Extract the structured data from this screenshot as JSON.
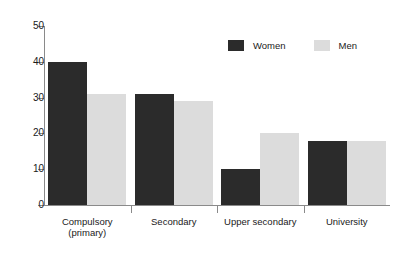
{
  "chart_data": {
    "type": "bar",
    "title": "",
    "subtitle": "",
    "xlabel": "",
    "ylabel": "",
    "ylim": [
      0,
      50
    ],
    "yticks": [
      0,
      10,
      20,
      30,
      40,
      50
    ],
    "grid": false,
    "legend_position": "top-right",
    "categories": [
      "Compulsory (primary)",
      "Secondary",
      "Upper secondary",
      "University"
    ],
    "category_lines": [
      [
        "Compulsory",
        "(primary)"
      ],
      [
        "Secondary"
      ],
      [
        "Upper secondary"
      ],
      [
        "University"
      ]
    ],
    "series": [
      {
        "name": "Women",
        "color": "#2b2b2b",
        "values": [
          40,
          31,
          10,
          18
        ]
      },
      {
        "name": "Men",
        "color": "#dcdcdc",
        "values": [
          31,
          29,
          20,
          18
        ]
      }
    ]
  },
  "axis": {
    "tick_labels": [
      "0",
      "10",
      "20",
      "30",
      "40",
      "50"
    ]
  },
  "legend": {
    "items": [
      {
        "label": "Women",
        "swatch": "women-swatch-icon"
      },
      {
        "label": "Men",
        "swatch": "men-swatch-icon"
      }
    ]
  }
}
